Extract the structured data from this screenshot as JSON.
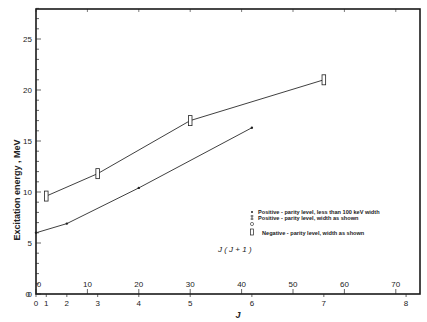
{
  "chart_data": {
    "type": "line",
    "title": "",
    "ylabel": "Excitation energy , MeV",
    "xlabel": "J",
    "secondary_xlabel": "J ( J + 1 )",
    "ylim": [
      0,
      28
    ],
    "xlim_jj1": [
      0,
      75
    ],
    "grid": false,
    "y_ticks": [
      "0",
      "5",
      "10",
      "15",
      "20",
      "25"
    ],
    "x_ticks_jj1": [
      "0",
      "10",
      "20",
      "30",
      "40",
      "50",
      "60",
      "70"
    ],
    "x_ticks_j": [
      "0",
      "1",
      "2",
      "3",
      "4",
      "5",
      "6",
      "7",
      "8"
    ],
    "series": [
      {
        "name": "Negative-parity level, width as shown",
        "marker": "open-rectangle",
        "J": [
          1,
          3,
          5,
          7
        ],
        "J_J_plus_1": [
          2,
          12,
          30,
          56
        ],
        "values": [
          9.6,
          11.8,
          17.0,
          21.0
        ]
      },
      {
        "name": "Positive-parity level, less than 100 keV width",
        "marker": "dot",
        "J": [
          0,
          2,
          4,
          6
        ],
        "J_J_plus_1": [
          0,
          6,
          20,
          42
        ],
        "values": [
          6.0,
          6.9,
          10.4,
          16.3
        ]
      }
    ],
    "legend": {
      "position": "lower-right-inside",
      "entries": [
        "Positive - parity level, less than 100 keV width",
        "Positive - parity level, width as shown",
        "Negative - parity level, width as shown"
      ]
    }
  },
  "labels": {
    "ylabel": "Excitation energy , MeV",
    "xlabel": "J",
    "jj1_label": "J ( J + 1 )",
    "legend": [
      "Positive - parity level, less than 100 keV width",
      "Positive - parity level, width as shown",
      "Negative - parity level, width as shown"
    ],
    "y_ticks": [
      "0",
      "5",
      "10",
      "15",
      "20",
      "25"
    ],
    "jj1_ticks": [
      "0",
      "10",
      "20",
      "30",
      "40",
      "50",
      "60",
      "70"
    ],
    "j_ticks": [
      "0",
      "1",
      "2",
      "3",
      "4",
      "5",
      "6",
      "7",
      "8"
    ]
  }
}
